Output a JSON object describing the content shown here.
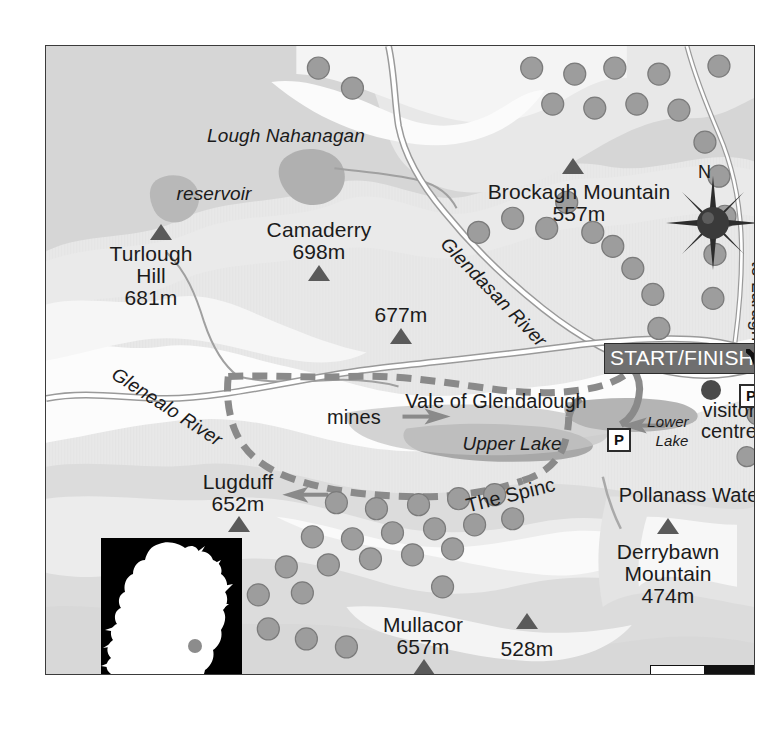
{
  "map": {
    "title_region": "Glendalough, Wicklow, Ireland",
    "peaks": [
      {
        "name": "Turlough\nHill",
        "label_line1": "Turlough",
        "label_line2": "Hill",
        "elevation": "681m",
        "x": 105,
        "y": 205
      },
      {
        "name": "Camaderry",
        "label_line1": "Camaderry",
        "label_line2": "",
        "elevation": "698m",
        "x": 273,
        "y": 183
      },
      {
        "name": "",
        "label_line1": "",
        "label_line2": "",
        "elevation": "677m",
        "x": 355,
        "y": 267
      },
      {
        "name": "Brockagh Mountain",
        "label_line1": "Brockagh Mountain",
        "label_line2": "",
        "elevation": "557m",
        "x": 533,
        "y": 143
      },
      {
        "name": "Lugduff",
        "label_line1": "Lugduff",
        "label_line2": "",
        "elevation": "652m",
        "x": 192,
        "y": 433
      },
      {
        "name": "Mullacor",
        "label_line1": "Mullacor",
        "label_line2": "",
        "elevation": "657m",
        "x": 377,
        "y": 576
      },
      {
        "name": "",
        "label_line1": "",
        "label_line2": "",
        "elevation": "528m",
        "x": 481,
        "y": 600
      },
      {
        "name": "Derrybawn Mountain",
        "label_line1": "Derrybawn",
        "label_line2": "Mountain",
        "elevation": "474m",
        "x": 622,
        "y": 503
      }
    ],
    "water_labels": [
      {
        "text": "Lough Nahanagan",
        "x": 240,
        "y": 88
      },
      {
        "text": "reservoir",
        "x": 168,
        "y": 146
      },
      {
        "text": "Upper Lake",
        "x": 466,
        "y": 396
      },
      {
        "text": "Lower",
        "x": 622,
        "y": 376
      },
      {
        "text": "Lake",
        "x": 626,
        "y": 395
      }
    ],
    "rivers": [
      {
        "name": "Glendasan River",
        "x": 405,
        "y": 188,
        "rotation": 46
      },
      {
        "name": "Glenealo River",
        "x": 73,
        "y": 318,
        "rotation": 33
      }
    ],
    "place_labels": [
      {
        "text": "Vale of Glendalough",
        "x": 450,
        "y": 353
      },
      {
        "text": "mines",
        "x": 308,
        "y": 369
      },
      {
        "text": "The Spinc",
        "x": 462,
        "y": 449,
        "rotation": -14
      },
      {
        "text": "Pollanass Waterfall",
        "x": 659,
        "y": 447
      },
      {
        "text": "visitor",
        "x": 683,
        "y": 362
      },
      {
        "text": "centre",
        "x": 683,
        "y": 381
      }
    ],
    "start_finish_label": "START/FINISH",
    "parking_label": "P",
    "parking_markers": [
      {
        "x": 693,
        "y": 338
      },
      {
        "x": 561,
        "y": 382
      }
    ],
    "direction_label": "to Laragh",
    "compass_label": "N",
    "scalebar": {
      "min": "0",
      "max": "1km"
    },
    "inset": {
      "label": "Ireland",
      "dot_label": "Glendalough"
    },
    "colors": {
      "terrain_high": "#d4d4d4",
      "terrain_mid": "#e2e2e2",
      "terrain_low": "#f2f2f2",
      "valley_floor": "#fcfcfc",
      "water": "#b4b4b4",
      "lake_dark": "#a9a9a9",
      "tree": "#9d9d9d",
      "tree_outline": "#7f7f7f",
      "trail": "#8a8a8a",
      "road": "#ffffff",
      "road_edge": "#9a9a9a",
      "text": "#1b1b1b",
      "frame": "#3b3b3b",
      "startfinish_bg": "#6f6f6f",
      "inset_bg": "#000000",
      "inset_land": "#ffffff",
      "inset_dot": "#8c8c8c"
    }
  }
}
